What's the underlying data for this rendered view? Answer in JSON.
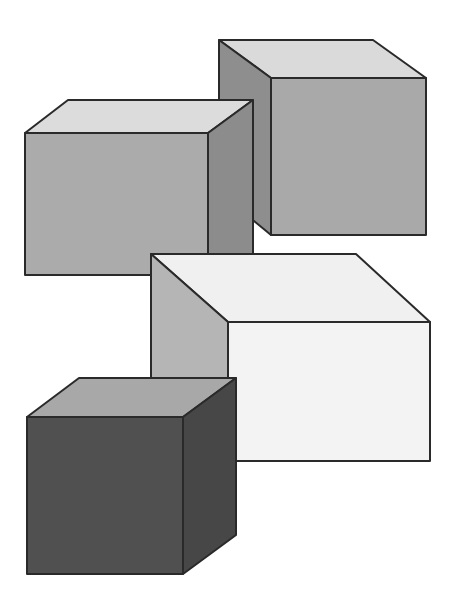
{
  "canvas": {
    "width": 456,
    "height": 608,
    "background": "#ffffff"
  },
  "scene": {
    "description": "Four shaded 3D boxes drawn in oblique projection",
    "stroke": "#2a2a2a",
    "cubes": [
      {
        "id": "top-right-cube",
        "faces": {
          "top": {
            "points": "219,40 373,40 426,78 271,78",
            "fill": "#dadada"
          },
          "side": {
            "points": "219,40 271,78 271,235 254,221 219,195",
            "fill": "#8e8e8e"
          },
          "front": {
            "points": "271,78 426,78 426,235 271,235",
            "fill": "#a9a9a9"
          }
        }
      },
      {
        "id": "top-left-cube",
        "faces": {
          "top": {
            "points": "25,133 68,100 253,100 208,133",
            "fill": "#dcdcdc"
          },
          "front": {
            "points": "25,133 208,133 208,275 25,275",
            "fill": "#ababab"
          },
          "side": {
            "points": "208,133 253,100 253,255 208,275",
            "fill": "#8c8c8c"
          }
        }
      },
      {
        "id": "middle-white-cube",
        "faces": {
          "top": {
            "points": "151,254 356,254 430,322 228,322",
            "fill": "#f0f0f0"
          },
          "side": {
            "points": "151,254 228,322 228,461 151,393",
            "fill": "#b5b5b5"
          },
          "front": {
            "points": "228,322 430,322 430,461 228,461",
            "fill": "#f3f3f3"
          }
        }
      },
      {
        "id": "bottom-dark-cube",
        "faces": {
          "top": {
            "points": "27,417 79,378 236,378 183,417",
            "fill": "#a8a8a8"
          },
          "front": {
            "points": "27,417 183,417 183,574 27,574",
            "fill": "#505050"
          },
          "side": {
            "points": "183,417 236,378 236,535 183,574",
            "fill": "#474747"
          }
        }
      }
    ]
  }
}
